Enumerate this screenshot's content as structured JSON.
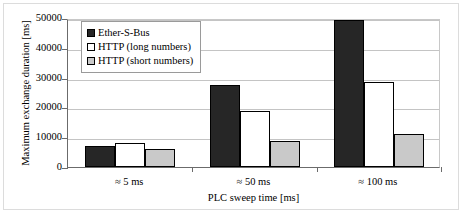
{
  "chart_data": {
    "type": "bar",
    "title": "",
    "xlabel": "PLC sweep time [ms]",
    "ylabel": "Maximum exchange duration  [ms]",
    "categories": [
      "≈ 5 ms",
      "≈ 50 ms",
      "≈ 100 ms"
    ],
    "series": [
      {
        "name": "Ether-S-Bus",
        "color": "#262626",
        "values": [
          7000,
          27500,
          49500
        ]
      },
      {
        "name": "HTTP (long numbers)",
        "color": "#ffffff",
        "values": [
          8000,
          18800,
          28500
        ]
      },
      {
        "name": "HTTP (short numbers)",
        "color": "#c9c9c9",
        "values": [
          6000,
          8800,
          11200
        ]
      }
    ],
    "ylim": [
      0,
      50000
    ],
    "yticks": [
      0,
      10000,
      20000,
      30000,
      40000,
      50000
    ],
    "ytick_labels": [
      "0",
      "10000",
      "20000",
      "30000",
      "40000",
      "50000"
    ],
    "grid": true,
    "legend_position": "upper-left-inside"
  }
}
